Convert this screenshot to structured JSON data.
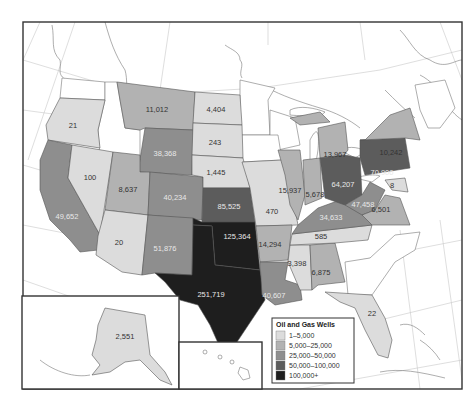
{
  "map": {
    "title": "Oil and Gas Wells",
    "colors": {
      "c1": "#dcdcdc",
      "c2": "#b2b2b2",
      "c3": "#8e8e8e",
      "c4": "#5c5c5c",
      "c5": "#1e1e1e",
      "nodata": "#ffffff"
    },
    "legend": {
      "title": "Oil and Gas Wells",
      "items": [
        {
          "label": "1–5,000",
          "class": "c1"
        },
        {
          "label": "5,000–25,000",
          "class": "c2"
        },
        {
          "label": "25,000–50,000",
          "class": "c3"
        },
        {
          "label": "50,000–100,000",
          "class": "c4"
        },
        {
          "label": "100,000+",
          "class": "c5"
        }
      ]
    },
    "states": {
      "oregon": "21",
      "california": "49,652",
      "nevada": "100",
      "montana": "11,012",
      "wyoming": "38,368",
      "utah": "8,637",
      "colorado": "40,234",
      "arizona": "20",
      "new_mexico": "51,876",
      "north_dakota": "4,404",
      "south_dakota": "243",
      "nebraska": "1,445",
      "kansas": "85,525",
      "oklahoma": "125,364",
      "texas": "251,719",
      "missouri": "470",
      "arkansas": "14,294",
      "louisiana": "40,607",
      "mississippi": "3,398",
      "alabama": "6,875",
      "tennessee": "585",
      "kentucky": "34,633",
      "illinois": "15,937",
      "indiana": "5,678",
      "michigan": "13,967",
      "ohio": "64,207",
      "west_virginia": "47,458",
      "virginia": "6,501",
      "pennsylvania": "70,900",
      "new_york": "10,242",
      "maryland": "8",
      "florida": "22",
      "alaska": "2,551"
    }
  }
}
